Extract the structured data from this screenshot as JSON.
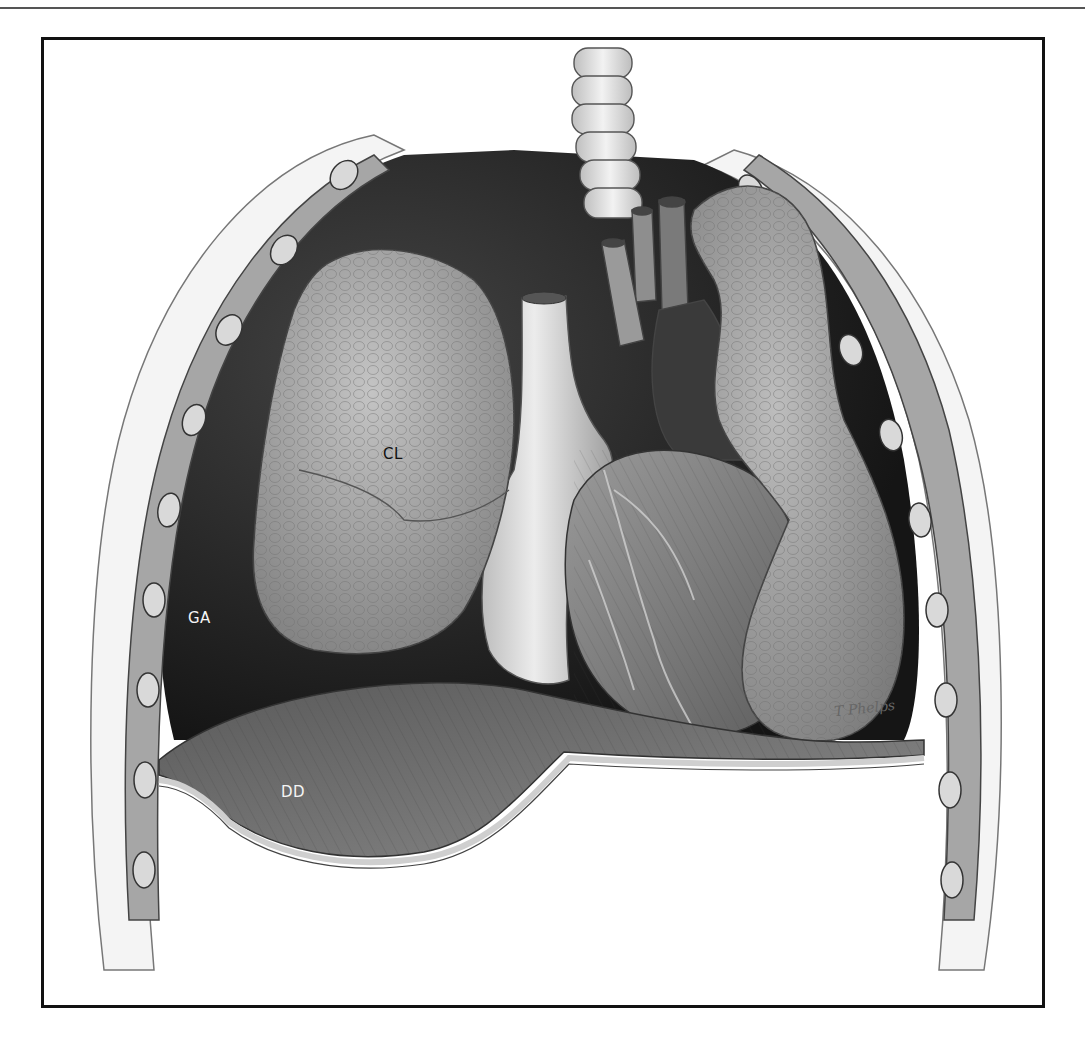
{
  "page": {
    "header_rule": true,
    "header_text_visible": "cropped (illegible running header fragments)"
  },
  "figure": {
    "type": "anatomical illustration",
    "style": "grayscale pencil/ink medical illustration",
    "labels": [
      {
        "id": "CL",
        "text": "CL",
        "color": "dark",
        "x": 339,
        "y": 405
      },
      {
        "id": "GA",
        "text": "GA",
        "color": "light",
        "x": 144,
        "y": 569
      },
      {
        "id": "DD",
        "text": "DD",
        "color": "light",
        "x": 237,
        "y": 743
      }
    ],
    "signature": "T Phelps",
    "colors": {
      "frame": "#111111",
      "background": "#ffffff",
      "dark_cavity": "#2a2a2a",
      "lung": "#9a9a9a",
      "heart": "#8c8c8c",
      "diaphragm": "#7a7a7a",
      "pleura": "#d8d8d8"
    }
  }
}
